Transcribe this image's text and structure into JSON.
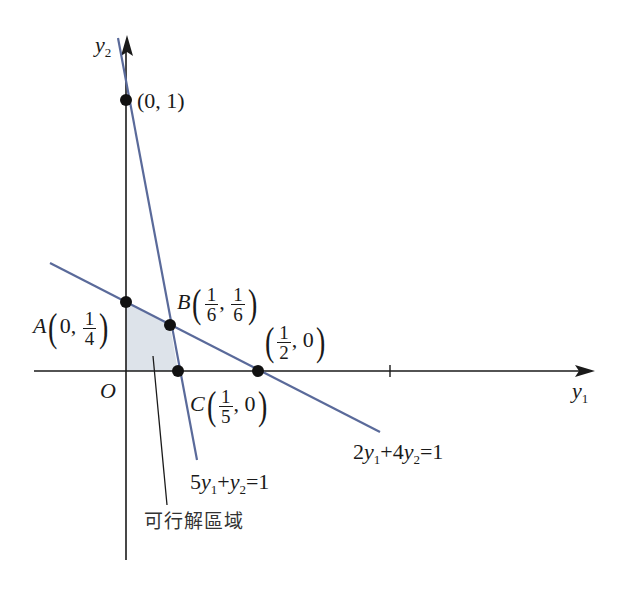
{
  "diagram": {
    "type": "linear-programming-feasible-region",
    "colors": {
      "axis": "#1a1a1a",
      "constraint_line": "#5a6a9a",
      "region_fill": "#dde3ea",
      "point": "#111111"
    },
    "axes": {
      "x_label": "y",
      "x_label_sub": "1",
      "y_label": "y",
      "y_label_sub": "2",
      "origin_label": "O",
      "x_tick": 1
    },
    "lines": [
      {
        "equation": "2y1+4y2=1",
        "label_parts": [
          "2",
          "y",
          "1",
          "+4",
          "y",
          "2",
          "=1"
        ]
      },
      {
        "equation": "5y1+y2=1",
        "label_parts": [
          "5",
          "y",
          "1",
          "+",
          "y",
          "2",
          "=1"
        ]
      }
    ],
    "points": [
      {
        "id": "A",
        "name": "A",
        "x": "0",
        "y_num": "1",
        "y_den": "4"
      },
      {
        "id": "B",
        "name": "B",
        "x_num": "1",
        "x_den": "6",
        "y_num": "1",
        "y_den": "6"
      },
      {
        "id": "C",
        "name": "C",
        "x_num": "1",
        "x_den": "5",
        "y": "0"
      },
      {
        "id": "D",
        "name": "",
        "x_num": "1",
        "x_den": "2",
        "y": "0"
      },
      {
        "id": "E",
        "name": "",
        "label": "(0, 1)"
      }
    ],
    "region_label": "可行解區域",
    "comma": ","
  }
}
